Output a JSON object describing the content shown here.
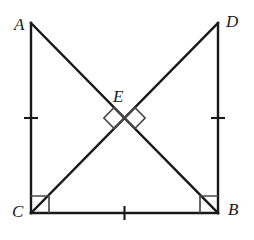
{
  "figure": {
    "kind": "geometry-diagram",
    "width": 254,
    "height": 240,
    "background_color": "#ffffff",
    "stroke_color": "#191919",
    "marker_color": "#4a4a4a",
    "labels": {
      "A": "A",
      "B": "B",
      "C": "C",
      "D": "D",
      "E": "E"
    },
    "points": {
      "A": {
        "x": 31,
        "y": 23
      },
      "D": {
        "x": 218,
        "y": 23
      },
      "C": {
        "x": 31,
        "y": 213
      },
      "B": {
        "x": 218,
        "y": 213
      },
      "E": {
        "x": 124.5,
        "y": 118
      }
    },
    "segments": [
      {
        "name": "AC",
        "from": "A",
        "to": "C",
        "style": "solid"
      },
      {
        "name": "DB",
        "from": "D",
        "to": "B",
        "style": "solid"
      },
      {
        "name": "CB",
        "from": "C",
        "to": "B",
        "style": "solid"
      },
      {
        "name": "AB",
        "from": "A",
        "to": "B",
        "style": "solid"
      },
      {
        "name": "CD",
        "from": "C",
        "to": "D",
        "style": "solid"
      }
    ],
    "tick_marks": [
      {
        "on": "AC",
        "count": 1,
        "x": 31,
        "y": 118
      },
      {
        "on": "DB",
        "count": 1,
        "x": 218,
        "y": 118
      },
      {
        "on": "CB",
        "count": 1,
        "x": 124.5,
        "y": 213
      }
    ],
    "right_angles": [
      {
        "at": "C",
        "style": "square",
        "size": 18
      },
      {
        "at": "B",
        "style": "square",
        "size": 18
      },
      {
        "at": "E",
        "style": "diamond",
        "side": "left",
        "size": 15
      },
      {
        "at": "E",
        "style": "diamond",
        "side": "right",
        "size": 15
      }
    ]
  }
}
